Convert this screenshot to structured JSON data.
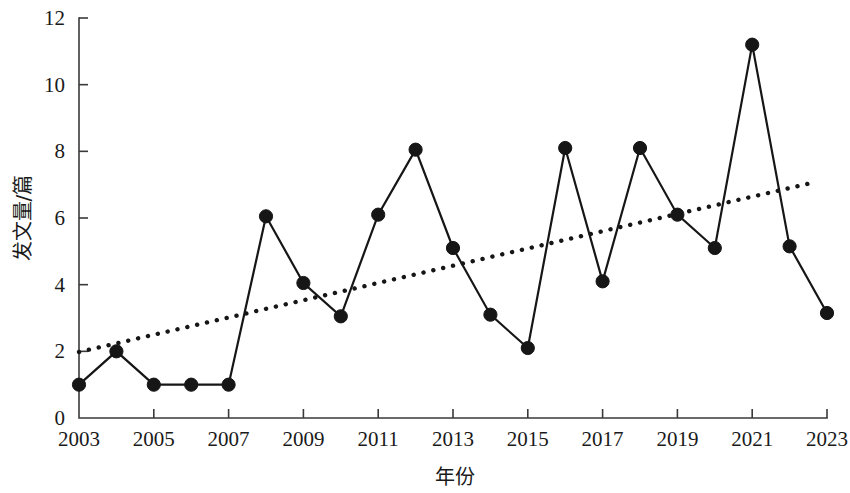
{
  "chart_data": {
    "type": "line",
    "title": "",
    "subtitle": "",
    "xlabel": "年份",
    "ylabel": "发文量/篇",
    "xlim": [
      2003,
      2023
    ],
    "ylim": [
      0,
      12
    ],
    "grid": false,
    "legend_position": "none",
    "x_tick_labels": [
      "2003",
      "2005",
      "2007",
      "2009",
      "2011",
      "2013",
      "2015",
      "2017",
      "2019",
      "2021",
      "2023"
    ],
    "x_tick_values": [
      2003,
      2005,
      2007,
      2009,
      2011,
      2013,
      2015,
      2017,
      2019,
      2021,
      2023
    ],
    "y_tick_labels": [
      "0",
      "2",
      "4",
      "6",
      "8",
      "10",
      "12"
    ],
    "y_tick_values": [
      0,
      2,
      4,
      6,
      8,
      10,
      12
    ],
    "x": [
      2003,
      2004,
      2005,
      2006,
      2007,
      2008,
      2009,
      2010,
      2011,
      2012,
      2013,
      2014,
      2015,
      2016,
      2017,
      2018,
      2019,
      2020,
      2021,
      2022,
      2023
    ],
    "series": [
      {
        "name": "发文量",
        "style": "line-marker",
        "color": "#161616",
        "values": [
          1.0,
          2.0,
          1.0,
          1.0,
          1.0,
          6.05,
          4.05,
          3.05,
          6.1,
          8.05,
          5.1,
          3.1,
          2.1,
          8.1,
          4.1,
          8.1,
          6.1,
          5.1,
          11.2,
          5.15,
          3.15
        ]
      },
      {
        "name": "趋势线",
        "style": "dotted-trend",
        "color": "#161616",
        "endpoints": [
          {
            "x": 2003,
            "y": 1.98
          },
          {
            "x": 2022.7,
            "y": 7.08
          }
        ]
      }
    ],
    "annotations": []
  },
  "axes": {
    "y_axis_title": "发文量/篇",
    "x_axis_title": "年份"
  }
}
